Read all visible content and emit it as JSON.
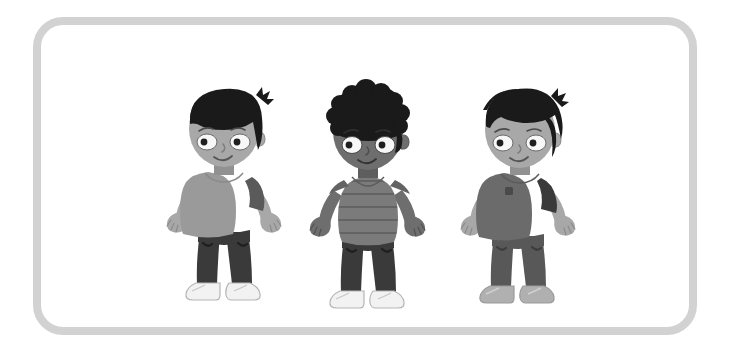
{
  "image": {
    "kind": "illustration",
    "title": "Three cartoon children standing side by side",
    "background_color": "#ffffff",
    "frame": {
      "shape": "rounded-rectangle",
      "border_color": "#d2d2d2",
      "border_width_px": 8,
      "corner_radius_px": 30,
      "x": 33,
      "y": 17,
      "width": 664,
      "height": 318
    }
  },
  "palette": {
    "white": "#ffffff",
    "frame_gray": "#d2d2d2",
    "hair_black": "#1a1a1a",
    "skin_light": "#a8a8a8",
    "skin_light_shadow": "#919191",
    "skin_dark": "#6e6e6e",
    "skin_dark_shadow": "#5e5e5e",
    "eye_white": "#f7f7f7",
    "pupil_black": "#1f1f1f",
    "shirt_light_gray": "#9a9a9a",
    "sleeve_dark_gray": "#5a5a5a",
    "shirt_stripe_gray": "#7b7b7b",
    "shirt_stripe_line": "#636363",
    "shirt_mid_gray": "#6b6b6b",
    "pants_dark": "#3a3a3a",
    "pants_mid": "#585858",
    "shoe_white": "#f2f2f2",
    "shoe_gray": "#b0b0b0",
    "outline": "#8a8a8a"
  },
  "figures": [
    {
      "id": "child-1",
      "position": "left",
      "hair": {
        "style": "bowl-cut-with-bangs",
        "color": "#1a1a1a"
      },
      "skin": {
        "tone": "light",
        "color": "#a8a8a8"
      },
      "shirt": {
        "style": "t-shirt-over-long-sleeve",
        "color": "#9a9a9a",
        "sleeve_color": "#5a5a5a"
      },
      "pants": {
        "style": "long-trousers",
        "color": "#3a3a3a"
      },
      "shoes": {
        "style": "sneakers",
        "color": "#f2f2f2"
      },
      "expression": "smiling"
    },
    {
      "id": "child-2",
      "position": "center",
      "hair": {
        "style": "curly-afro",
        "color": "#1a1a1a"
      },
      "skin": {
        "tone": "dark",
        "color": "#6e6e6e"
      },
      "shirt": {
        "style": "horizontal-striped-tee",
        "color": "#7b7b7b",
        "stripe_color": "#636363"
      },
      "pants": {
        "style": "long-trousers",
        "color": "#3a3a3a"
      },
      "shoes": {
        "style": "sneakers",
        "color": "#f2f2f2"
      },
      "expression": "smiling"
    },
    {
      "id": "child-3",
      "position": "right",
      "hair": {
        "style": "spiky-tousled",
        "color": "#1a1a1a"
      },
      "skin": {
        "tone": "light",
        "color": "#a8a8a8"
      },
      "shirt": {
        "style": "tee-with-pocket-over-dark-sleeve",
        "color": "#6b6b6b",
        "sleeve_color": "#3a3a3a",
        "pocket_color": "#4a4a4a"
      },
      "pants": {
        "style": "long-trousers",
        "color": "#585858"
      },
      "shoes": {
        "style": "sneakers",
        "color": "#b0b0b0"
      },
      "expression": "smiling"
    }
  ]
}
